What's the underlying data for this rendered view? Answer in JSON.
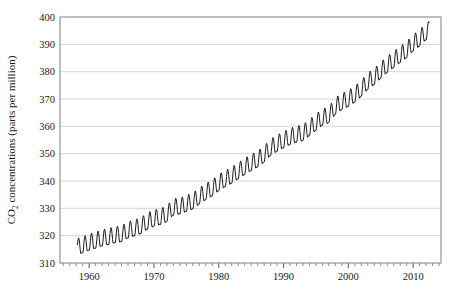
{
  "chart_data": {
    "type": "line",
    "title": "",
    "subtitle": "",
    "xlabel": "",
    "ylabel": "CO2 concentrations (parts per million)",
    "ylabel_parts": {
      "prefix": "CO",
      "sub": "2",
      "suffix": " concentrations (parts per million)"
    },
    "grid": true,
    "legend": "none",
    "xlim": [
      1955.5,
      2014.3
    ],
    "ylim": [
      310,
      400
    ],
    "yticks": [
      310,
      320,
      330,
      340,
      350,
      360,
      370,
      380,
      390,
      400
    ],
    "ytick_labels": [
      "310",
      "320",
      "330",
      "340",
      "350",
      "360",
      "370",
      "380",
      "390",
      "400"
    ],
    "xticks_major": [
      1960,
      1970,
      1980,
      1990,
      2000,
      2010
    ],
    "xtick_labels": [
      "1960",
      "1970",
      "1980",
      "1990",
      "2000",
      "2010"
    ],
    "xticks_minor_step": 1,
    "series": [
      {
        "name": "Mauna Loa monthly mean CO2",
        "color": "#111111",
        "seasonal_amplitude_ppm": 3.1,
        "seasonal_peak_month_fraction": 0.37,
        "x_start": 1958.2,
        "x_end": 2012.45,
        "annual_mean_x": [
          1958,
          1959,
          1960,
          1961,
          1962,
          1963,
          1964,
          1965,
          1966,
          1967,
          1968,
          1969,
          1970,
          1971,
          1972,
          1973,
          1974,
          1975,
          1976,
          1977,
          1978,
          1979,
          1980,
          1981,
          1982,
          1983,
          1984,
          1985,
          1986,
          1987,
          1988,
          1989,
          1990,
          1991,
          1992,
          1993,
          1994,
          1995,
          1996,
          1997,
          1998,
          1999,
          2000,
          2001,
          2002,
          2003,
          2004,
          2005,
          2006,
          2007,
          2008,
          2009,
          2010,
          2011,
          2012
        ],
        "annual_mean_y": [
          315.3,
          315.98,
          316.91,
          317.64,
          318.45,
          318.99,
          319.62,
          320.04,
          321.38,
          322.16,
          323.04,
          324.62,
          325.68,
          326.32,
          327.45,
          329.68,
          330.17,
          331.08,
          332.05,
          333.78,
          335.41,
          336.78,
          338.68,
          340.1,
          341.44,
          343.03,
          344.58,
          346.04,
          347.39,
          349.16,
          351.56,
          353.07,
          354.35,
          355.57,
          356.38,
          357.07,
          358.82,
          360.8,
          362.59,
          363.71,
          366.65,
          368.33,
          369.52,
          371.13,
          373.22,
          375.77,
          377.49,
          379.8,
          381.9,
          383.76,
          385.59,
          387.38,
          389.78,
          391.63,
          393.82
        ],
        "first_value_ppm": 315.3,
        "last_value_ppm": 393.8,
        "min_plotted_ppm": 313.5,
        "max_plotted_ppm": 396.0
      }
    ],
    "source_description": "Atmospheric CO2 concentration, monthly mean with seasonal cycle, 1958-2012"
  },
  "figure": {
    "plot_area": {
      "left": 60,
      "top": 17,
      "right": 441,
      "bottom": 263
    },
    "background_color": "#ffffff",
    "grid_color": "#c9c9c9",
    "frame_color": "#8a8a8a",
    "line_color": "#111111"
  }
}
